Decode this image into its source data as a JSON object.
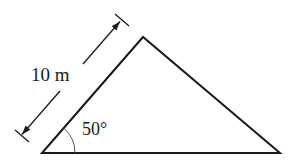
{
  "diagram": {
    "shape": "triangle",
    "side_length_label": "10 m",
    "angle_label": "50°",
    "stroke_color": "#1a1a1a",
    "background": "#ffffff"
  }
}
